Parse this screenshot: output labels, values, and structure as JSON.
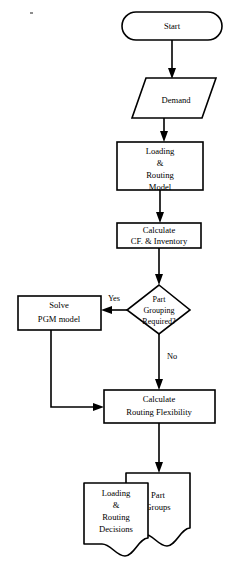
{
  "diagram": {
    "background_color": "#ffffff",
    "line_color": "#000000",
    "nodes": {
      "start": {
        "shape": "terminator",
        "label": "Start"
      },
      "demand": {
        "shape": "parallelogram-input",
        "label": "Demand"
      },
      "loading_routing_model": {
        "shape": "process",
        "line1": "Loading",
        "line2": "&",
        "line3": "Routing",
        "line4": "Model"
      },
      "calculate_cf_inventory": {
        "shape": "process",
        "line1": "Calculate",
        "line2": "CF. & Inventory"
      },
      "part_grouping_decision": {
        "shape": "decision",
        "line1": "Part",
        "line2": "Grouping",
        "line3": "Required?"
      },
      "solve_pgm_model": {
        "shape": "process",
        "line1": "Solve",
        "line2": "PGM model"
      },
      "calculate_routing_flexibility": {
        "shape": "process",
        "line1": "Calculate",
        "line2": "Routing Flexibility"
      },
      "loading_routing_decisions": {
        "shape": "document",
        "line1": "Loading",
        "line2": "&",
        "line3": "Routing",
        "line4": "Decisions"
      },
      "part_groups": {
        "shape": "document",
        "line1": "Part",
        "line2": "Groups"
      }
    },
    "edges": {
      "yes_branch_label": "Yes",
      "no_branch_label": "No"
    }
  }
}
